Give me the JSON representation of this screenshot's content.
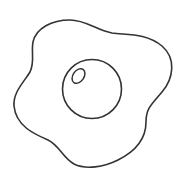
{
  "image": {
    "subject": "fried egg line drawing",
    "icon": "fried-egg-icon",
    "colors": {
      "background": "#ffffff",
      "stroke": "#333333"
    },
    "parts": [
      {
        "name": "egg-white"
      },
      {
        "name": "yolk"
      },
      {
        "name": "yolk-highlight"
      }
    ]
  }
}
